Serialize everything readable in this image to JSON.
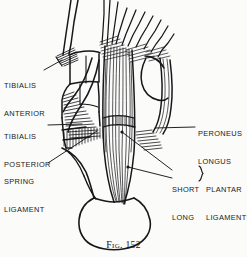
{
  "figure": {
    "caption_prefix": "Fig.",
    "caption_number": "152",
    "caption_full": "Fig. 152",
    "ink_color": "#17171a",
    "background_color": "#fbfbfa"
  },
  "annotations": {
    "tibialis_anterior": {
      "line1": "TIBIALIS",
      "line2": "ANTERIOR",
      "side": "left"
    },
    "tibialis_posterior": {
      "line1": "TIBIALIS",
      "line2": "POSTERIOR",
      "side": "left"
    },
    "spring_ligament": {
      "line1": "SPRING",
      "line2": "LIGAMENT",
      "side": "left"
    },
    "peroneus_longus": {
      "line1": "PERONEUS",
      "line2": "LONGUS",
      "side": "right"
    },
    "short_long": {
      "line1": "SHORT",
      "line2": "LONG",
      "side": "right"
    },
    "plantar_ligaments": {
      "line1": "PLANTAR",
      "line2": "LIGAMENTS",
      "side": "right"
    }
  }
}
